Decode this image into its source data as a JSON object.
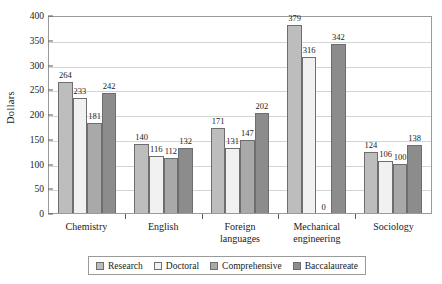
{
  "chart_data": {
    "type": "bar",
    "title": "",
    "subtitle": "",
    "xlabel": "",
    "ylabel": "Dollars",
    "ylim": [
      0,
      400
    ],
    "ytick_step": 50,
    "yticks": [
      0,
      50,
      100,
      150,
      200,
      250,
      300,
      350,
      400
    ],
    "ytick_labels": [
      "0",
      "50",
      "100",
      "150",
      "200",
      "250",
      "300",
      "350",
      "400"
    ],
    "grid": "horizontal",
    "legend_position": "bottom",
    "categories": [
      "Chemistry",
      "English",
      "Foreign languages",
      "Mechanical engineering",
      "Sociology"
    ],
    "category_lines": [
      [
        "Chemistry"
      ],
      [
        "English"
      ],
      [
        "Foreign",
        "languages"
      ],
      [
        "Mechanical",
        "engineering"
      ],
      [
        "Sociology"
      ]
    ],
    "series": [
      {
        "name": "Research",
        "color": "#bdbdbd",
        "values": [
          264,
          140,
          171,
          379,
          124
        ],
        "labels": [
          "264",
          "140",
          "171",
          "379",
          "124"
        ]
      },
      {
        "name": "Doctoral",
        "color": "#f1f1f1",
        "values": [
          233,
          116,
          131,
          316,
          106
        ],
        "labels": [
          "233",
          "116",
          "131",
          "316",
          "106"
        ]
      },
      {
        "name": "Comprehensive",
        "color": "#a9a9a9",
        "values": [
          181,
          112,
          147,
          0,
          100
        ],
        "labels": [
          "181",
          "112",
          "147",
          "0",
          "100"
        ]
      },
      {
        "name": "Baccalaureate",
        "color": "#8c8c8c",
        "values": [
          242,
          132,
          202,
          342,
          138
        ],
        "labels": [
          "242",
          "132",
          "202",
          "342",
          "138"
        ]
      }
    ]
  },
  "legend": {
    "items": [
      {
        "label": "Research",
        "color": "#bdbdbd"
      },
      {
        "label": "Doctoral",
        "color": "#f1f1f1"
      },
      {
        "label": "Comprehensive",
        "color": "#a9a9a9"
      },
      {
        "label": "Baccalaureate",
        "color": "#8c8c8c"
      }
    ]
  },
  "axis": {
    "y_title": "Dollars"
  },
  "colors": {
    "plot_border": "#9a9a9a",
    "gridline": "#d4d4d4",
    "bar_border": "#6e6e6e",
    "text": "#1a1a1a",
    "background": "#ffffff"
  }
}
